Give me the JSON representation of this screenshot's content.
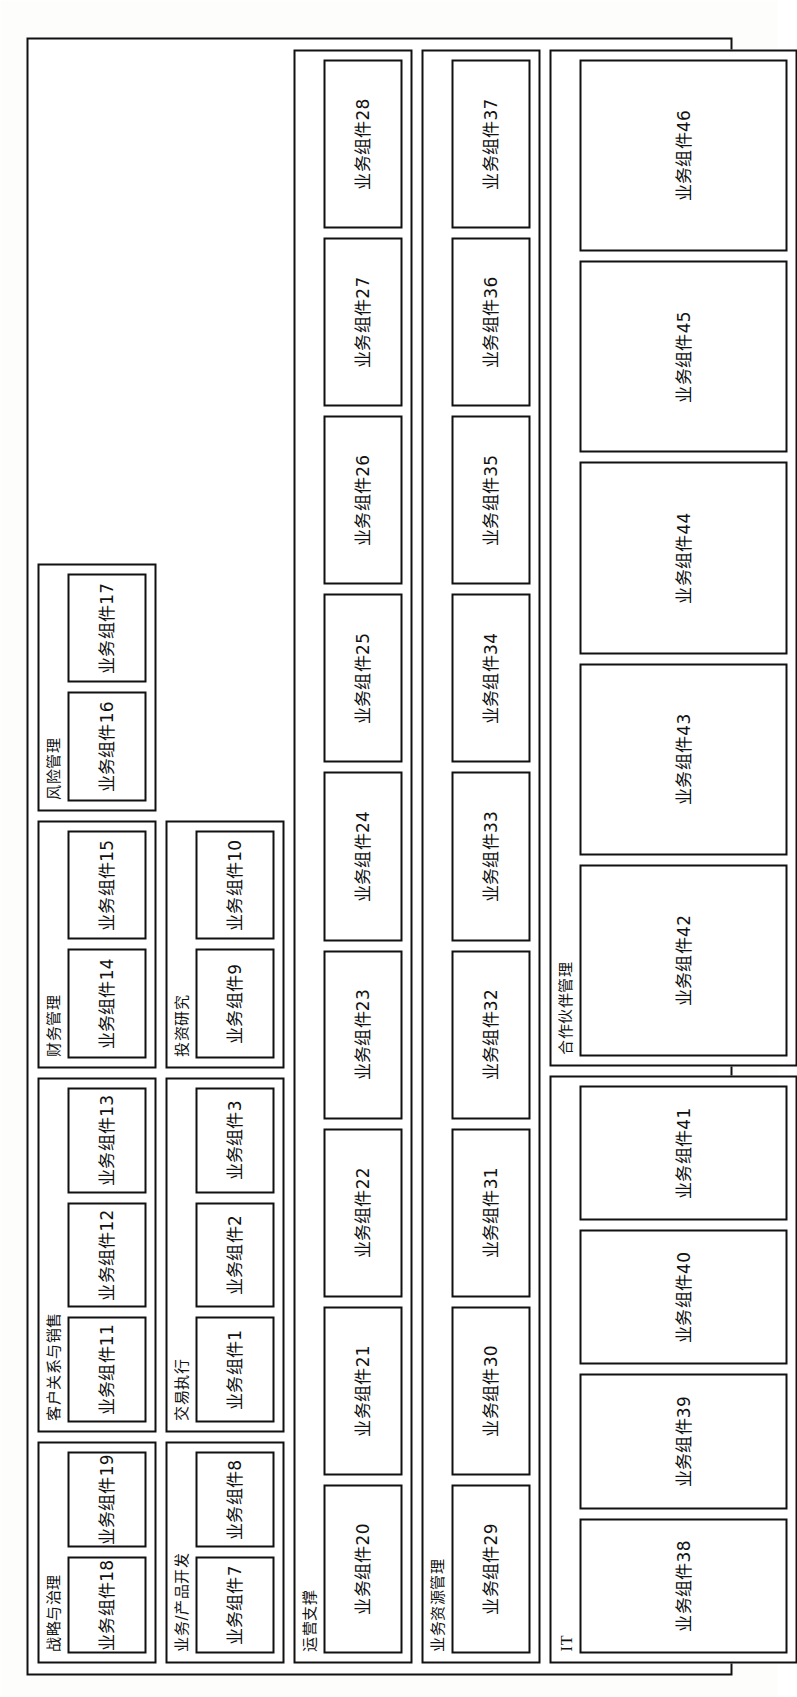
{
  "figure": {
    "type": "business-component-map",
    "orientation": "rotated-90-ccw",
    "component_label_prefix": "业务组件"
  },
  "bands": [
    {
      "id": "band-1",
      "groups": [
        {
          "id": "strategy-governance",
          "title": "战略与治理",
          "title_script": "cjk",
          "components": [
            "业务组件18",
            "业务组件19"
          ]
        },
        {
          "id": "customer-relations-sales",
          "title": "客户关系与销售",
          "title_script": "cjk",
          "components": [
            "业务组件11",
            "业务组件12",
            "业务组件13"
          ]
        },
        {
          "id": "financial-management",
          "title": "财务管理",
          "title_script": "cjk",
          "components": [
            "业务组件14",
            "业务组件15"
          ]
        },
        {
          "id": "risk-management",
          "title": "风险管理",
          "title_script": "cjk",
          "components": [
            "业务组件16",
            "业务组件17"
          ]
        }
      ]
    },
    {
      "id": "band-2",
      "groups": [
        {
          "id": "business-product-development",
          "title": "业务/产品开发",
          "title_script": "cjk",
          "components": [
            "业务组件7",
            "业务组件8"
          ]
        },
        {
          "id": "trade-execution",
          "title": "交易执行",
          "title_script": "cjk",
          "components": [
            "业务组件1",
            "业务组件2",
            "业务组件3"
          ]
        },
        {
          "id": "investment-research",
          "title": "投资研究",
          "title_script": "cjk",
          "components": [
            "业务组件9",
            "业务组件10"
          ]
        }
      ]
    },
    {
      "id": "band-3",
      "groups": [
        {
          "id": "operations-support",
          "title": "运营支撑",
          "title_script": "cjk",
          "components": [
            "业务组件20",
            "业务组件21",
            "业务组件22",
            "业务组件23",
            "业务组件24",
            "业务组件25",
            "业务组件26",
            "业务组件27",
            "业务组件28"
          ]
        }
      ]
    },
    {
      "id": "band-4",
      "groups": [
        {
          "id": "business-resource-management",
          "title": "业务资源管理",
          "title_script": "cjk",
          "components": [
            "业务组件29",
            "业务组件30",
            "业务组件31",
            "业务组件32",
            "业务组件33",
            "业务组件34",
            "业务组件35",
            "业务组件36",
            "业务组件37"
          ]
        }
      ]
    },
    {
      "id": "band-5",
      "groups": [
        {
          "id": "it",
          "title": "IT",
          "title_script": "latin",
          "components": [
            "业务组件38",
            "业务组件39",
            "业务组件40",
            "业务组件41"
          ]
        },
        {
          "id": "partner-management",
          "title": "合作伙伴管理",
          "title_script": "cjk",
          "components": [
            "业务组件42",
            "业务组件43",
            "业务组件44",
            "业务组件45",
            "业务组件46"
          ]
        }
      ]
    }
  ]
}
